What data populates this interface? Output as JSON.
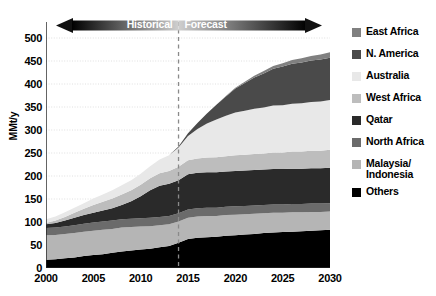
{
  "chart_data": {
    "type": "area",
    "stacked": true,
    "title": "",
    "xlabel": "",
    "ylabel": "MMt/y",
    "xlim": [
      2000,
      2030
    ],
    "ylim": [
      0,
      500
    ],
    "ytick_step": 50,
    "xtick_step": 5,
    "grid": true,
    "legend_position": "right",
    "xticks": [
      "2000",
      "2005",
      "2010",
      "2015",
      "2020",
      "2025",
      "2030"
    ],
    "yticks": [
      "0",
      "50",
      "100",
      "150",
      "200",
      "250",
      "300",
      "350",
      "400",
      "450",
      "500"
    ],
    "x": [
      2000,
      2001,
      2002,
      2003,
      2004,
      2005,
      2006,
      2007,
      2008,
      2009,
      2010,
      2011,
      2012,
      2013,
      2014,
      2015,
      2016,
      2017,
      2018,
      2019,
      2020,
      2021,
      2022,
      2023,
      2024,
      2025,
      2026,
      2027,
      2028,
      2029,
      2030
    ],
    "series": [
      {
        "name": "Others",
        "color": "#000000",
        "values": [
          18,
          19,
          21,
          23,
          26,
          28,
          30,
          33,
          36,
          38,
          40,
          42,
          45,
          48,
          55,
          63,
          66,
          67,
          68,
          70,
          71,
          73,
          74,
          76,
          77,
          78,
          79,
          80,
          81,
          82,
          83
        ]
      },
      {
        "name": "Malaysia/\nIndonesia",
        "color": "#b5b5b5",
        "values": [
          53,
          53,
          53,
          53,
          53,
          53,
          53,
          52,
          52,
          51,
          50,
          49,
          48,
          47,
          46,
          46,
          46,
          46,
          45,
          45,
          45,
          44,
          44,
          43,
          43,
          42,
          42,
          41,
          41,
          40,
          40
        ]
      },
      {
        "name": "North Africa",
        "color": "#6b6b6b",
        "values": [
          16,
          16,
          16,
          17,
          17,
          18,
          18,
          18,
          18,
          18,
          18,
          18,
          18,
          18,
          18,
          18,
          18,
          18,
          18,
          18,
          18,
          18,
          18,
          18,
          18,
          18,
          18,
          18,
          18,
          18,
          18
        ]
      },
      {
        "name": "Qatar",
        "color": "#2a2a2a",
        "values": [
          8,
          10,
          13,
          16,
          19,
          21,
          24,
          27,
          31,
          38,
          48,
          60,
          68,
          70,
          72,
          77,
          77,
          77,
          77,
          77,
          77,
          77,
          77,
          77,
          77,
          77,
          77,
          77,
          77,
          77,
          77
        ]
      },
      {
        "name": "West Africa",
        "color": "#bdbdbd",
        "values": [
          3,
          5,
          8,
          11,
          14,
          17,
          19,
          21,
          23,
          24,
          25,
          26,
          27,
          28,
          29,
          30,
          31,
          32,
          33,
          33,
          34,
          34,
          35,
          35,
          36,
          36,
          37,
          37,
          38,
          38,
          39
        ]
      },
      {
        "name": "Australia",
        "color": "#e8e8e8",
        "values": [
          8,
          9,
          10,
          11,
          12,
          14,
          16,
          18,
          20,
          22,
          24,
          26,
          30,
          34,
          42,
          53,
          64,
          74,
          82,
          88,
          93,
          96,
          98,
          100,
          102,
          103,
          104,
          105,
          106,
          107,
          108
        ]
      },
      {
        "name": "N. America",
        "color": "#4a4a4a",
        "values": [
          0,
          0,
          0,
          0,
          0,
          0,
          0,
          0,
          0,
          0,
          0,
          0,
          0,
          0,
          2,
          6,
          13,
          22,
          32,
          42,
          52,
          60,
          68,
          74,
          80,
          84,
          87,
          89,
          90,
          91,
          92
        ]
      },
      {
        "name": "East Africa",
        "color": "#808080",
        "values": [
          0,
          0,
          0,
          0,
          0,
          0,
          0,
          0,
          0,
          0,
          0,
          0,
          0,
          0,
          0,
          0,
          0,
          0,
          0,
          1,
          2,
          3,
          4,
          5,
          6,
          7,
          8,
          9,
          10,
          11,
          12
        ]
      }
    ],
    "totals_note": "Total reaches about 437 MMt/y in 2030",
    "forecast_divider_year": 2014
  },
  "era": {
    "historical_label": "Historical",
    "forecast_label": "Forecast"
  },
  "legend": {
    "items": [
      {
        "label": "East Africa",
        "color": "#808080"
      },
      {
        "label": "N. America",
        "color": "#4a4a4a"
      },
      {
        "label": "Australia",
        "color": "#e8e8e8"
      },
      {
        "label": "West Africa",
        "color": "#bdbdbd"
      },
      {
        "label": "Qatar",
        "color": "#2a2a2a"
      },
      {
        "label": "North Africa",
        "color": "#6b6b6b"
      },
      {
        "label": "Malaysia/\nIndonesia",
        "color": "#b5b5b5"
      },
      {
        "label": "Others",
        "color": "#000000"
      }
    ]
  }
}
